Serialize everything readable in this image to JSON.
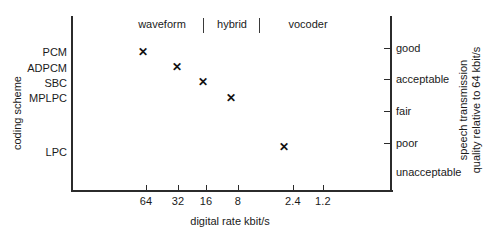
{
  "chart_data": {
    "type": "scatter",
    "title": "",
    "xlabel": "digital rate kbit/s",
    "ylabel": "coding scheme",
    "y2label_lines": [
      "quality relative to 64 kbit/s",
      "speech transmission"
    ],
    "grid": false,
    "legend": "none",
    "x_tick_labels": [
      "64",
      "32",
      "16",
      "8",
      "2.4",
      "1.2"
    ],
    "x_tick_px": [
      146,
      178,
      206,
      238,
      293,
      323
    ],
    "y_left_categories": [
      "PCM",
      "ADPCM",
      "SBC",
      "MPLPC",
      "LPC"
    ],
    "y_left_px": [
      52,
      68,
      83,
      98,
      152
    ],
    "y_right_categories": [
      "good",
      "acceptable",
      "fair",
      "poor",
      "unacceptable"
    ],
    "y_right_px": [
      48,
      79,
      111,
      143,
      172
    ],
    "y_right_ticked": [
      true,
      true,
      true,
      true,
      false
    ],
    "categories_band": [
      {
        "label": "waveform",
        "center_px": 162
      },
      {
        "label": "hybrid",
        "center_px": 232
      },
      {
        "label": "vocoder",
        "center_px": 308
      }
    ],
    "category_separators_px": [
      203,
      259
    ],
    "points": [
      {
        "scheme": "PCM",
        "rate_kbit_s": "64",
        "quality": "good",
        "x_px": 143,
        "y_px": 52,
        "marker": "x"
      },
      {
        "scheme": "ADPCM",
        "rate_kbit_s": "32",
        "quality": "good-acceptable",
        "x_px": 177,
        "y_px": 67,
        "marker": "x"
      },
      {
        "scheme": "SBC",
        "rate_kbit_s": "16",
        "quality": "acceptable",
        "x_px": 203,
        "y_px": 82,
        "marker": "x"
      },
      {
        "scheme": "MPLPC",
        "rate_kbit_s": "8",
        "quality": "acceptable",
        "x_px": 231,
        "y_px": 98,
        "marker": "x"
      },
      {
        "scheme": "LPC",
        "rate_kbit_s": "2.4",
        "quality": "poor",
        "x_px": 284,
        "y_px": 147,
        "marker": "x"
      }
    ],
    "marker_glyph": "✕",
    "colors": {
      "axis": "#2b2b2b",
      "text": "#1a1a1a",
      "marker": "#111111",
      "background": "#ffffff"
    }
  }
}
